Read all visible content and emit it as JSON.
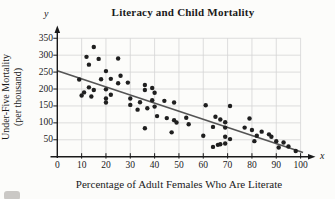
{
  "figure": {
    "title": "Literacy and Child Mortality",
    "x_axis_label": "Percentage of Adult Females Who Are Literate",
    "y_axis_label_line1": "Under-Five Mortality",
    "y_axis_label_line2": "(per thousand)",
    "x_symbol": "x",
    "y_symbol": "y"
  },
  "colors": {
    "dot": "#1f1f1f",
    "trend_line": "#555555",
    "grid": "#d4d4d4",
    "axis": "#1a1a1a",
    "background": "#fcfcfa",
    "text": "#1a1a1a"
  },
  "chart_data": {
    "type": "scatter",
    "title": "Literacy and Child Mortality",
    "xlabel": "Percentage of Adult Females Who Are Literate",
    "ylabel": "Under-Five Mortality (per thousand)",
    "xlim": [
      0,
      105
    ],
    "ylim": [
      0,
      380
    ],
    "x_ticks": [
      0,
      10,
      20,
      30,
      40,
      50,
      60,
      70,
      80,
      90,
      100
    ],
    "y_ticks": [
      50,
      100,
      150,
      200,
      250,
      300,
      350
    ],
    "grid": true,
    "legend": false,
    "points": [
      [
        9,
        228
      ],
      [
        12,
        295
      ],
      [
        15,
        324
      ],
      [
        17,
        289
      ],
      [
        25,
        290
      ],
      [
        13,
        272
      ],
      [
        20,
        253
      ],
      [
        18,
        229
      ],
      [
        22,
        230
      ],
      [
        25,
        217
      ],
      [
        13,
        205
      ],
      [
        15,
        197
      ],
      [
        20,
        199
      ],
      [
        11,
        190
      ],
      [
        10,
        181
      ],
      [
        14,
        178
      ],
      [
        22,
        183
      ],
      [
        20,
        172
      ],
      [
        20,
        160
      ],
      [
        26,
        239
      ],
      [
        29,
        219
      ],
      [
        30,
        172
      ],
      [
        30,
        153
      ],
      [
        33,
        139
      ],
      [
        34,
        161
      ],
      [
        37,
        143
      ],
      [
        36,
        212
      ],
      [
        36,
        197
      ],
      [
        39,
        203
      ],
      [
        40,
        189
      ],
      [
        39,
        167
      ],
      [
        44,
        165
      ],
      [
        48,
        160
      ],
      [
        40,
        148
      ],
      [
        41,
        120
      ],
      [
        45,
        114
      ],
      [
        48,
        108
      ],
      [
        49,
        101
      ],
      [
        36,
        84
      ],
      [
        47,
        72
      ],
      [
        53,
        115
      ],
      [
        54,
        96
      ],
      [
        61,
        152
      ],
      [
        71,
        150
      ],
      [
        65,
        118
      ],
      [
        67,
        110
      ],
      [
        69,
        102
      ],
      [
        64,
        88
      ],
      [
        69,
        86
      ],
      [
        60,
        62
      ],
      [
        69,
        59
      ],
      [
        71,
        52
      ],
      [
        64,
        29
      ],
      [
        66,
        35
      ],
      [
        67,
        37
      ],
      [
        69,
        39
      ],
      [
        79,
        113
      ],
      [
        77,
        86
      ],
      [
        80,
        79
      ],
      [
        84,
        74
      ],
      [
        82,
        62
      ],
      [
        87,
        66
      ],
      [
        88,
        59
      ],
      [
        81,
        46
      ],
      [
        90,
        46
      ],
      [
        93,
        42
      ],
      [
        91,
        27
      ],
      [
        95,
        30
      ],
      [
        98,
        17
      ]
    ],
    "trend_line": {
      "intercept": 254,
      "slope": -2.39,
      "x_start": 0,
      "x_end": 101
    }
  }
}
